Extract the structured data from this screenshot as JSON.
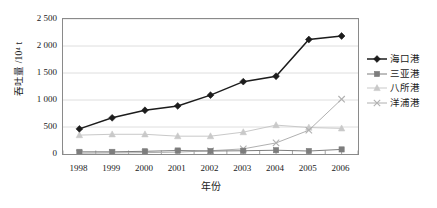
{
  "chart_data": {
    "type": "line",
    "title": "",
    "xlabel": "年份",
    "ylabel": "吞吐量 /10⁴ t",
    "categories": [
      "1998",
      "1999",
      "2000",
      "2001",
      "2002",
      "2003",
      "2004",
      "2005",
      "2006"
    ],
    "x": [
      1998,
      1999,
      2000,
      2001,
      2002,
      2003,
      2004,
      2005,
      2006
    ],
    "ylim": [
      0,
      2500
    ],
    "yticks": [
      "0",
      "500",
      "1 000",
      "1 500",
      "2 000",
      "2 500"
    ],
    "ytick_values": [
      0,
      500,
      1000,
      1500,
      2000,
      2500
    ],
    "grid": "horizontal",
    "legend_position": "right",
    "series": [
      {
        "name": "海口港",
        "marker": "diamond",
        "color": "#1c1c1c",
        "values": [
          465,
          670,
          810,
          890,
          1090,
          1340,
          1440,
          2120,
          2185
        ]
      },
      {
        "name": "三亚港",
        "marker": "square",
        "color": "#7d7d7d",
        "values": [
          40,
          40,
          50,
          65,
          55,
          60,
          70,
          55,
          85
        ]
      },
      {
        "name": "八所港",
        "marker": "triangle",
        "color": "#c9c9c9",
        "values": [
          350,
          365,
          365,
          330,
          330,
          405,
          535,
          490,
          475
        ]
      },
      {
        "name": "洋浦港",
        "marker": "cross",
        "color": "#b0b0b0",
        "values": [
          15,
          20,
          25,
          35,
          60,
          95,
          205,
          440,
          1015
        ]
      }
    ]
  },
  "legend": {
    "items": [
      {
        "label": "海口港"
      },
      {
        "label": "三亚港"
      },
      {
        "label": "八所港"
      },
      {
        "label": "洋浦港"
      }
    ]
  }
}
